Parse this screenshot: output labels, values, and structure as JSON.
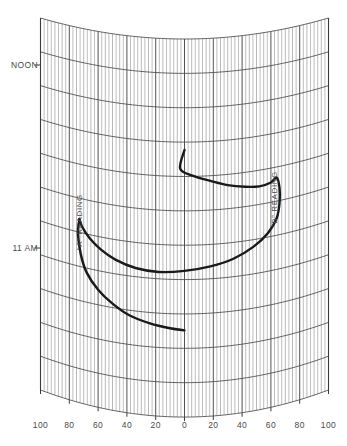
{
  "chart_data": {
    "type": "line",
    "title": "",
    "subtitle": "",
    "xlabel": "",
    "ylabel": "",
    "grid": true,
    "legend_position": "inline-annotations",
    "x_axis": {
      "tick_labels": [
        "100",
        "80",
        "60",
        "40",
        "20",
        "0",
        "20",
        "40",
        "60",
        "80",
        "100"
      ],
      "tick_values": [
        -100,
        -80,
        -60,
        -40,
        -20,
        0,
        20,
        40,
        60,
        80,
        100
      ],
      "xlim": [
        -100,
        100
      ],
      "minor_tick_step": 5
    },
    "y_axis": {
      "tick_labels": [
        "NOON",
        "11 AM"
      ],
      "tick_values": [
        12.0,
        11.0
      ],
      "ylim_top_label": "NOON",
      "ylim_bottom_label": "11 AM"
    },
    "annotations": [
      {
        "id": "a-reading",
        "text": "“A” READING",
        "orientation": "vertical",
        "x": -70,
        "y_span": [
          11.2,
          11.9
        ]
      },
      {
        "id": "b-reading",
        "text": "“B” READING",
        "orientation": "vertical",
        "x": 62,
        "y_span": [
          11.4,
          12.1
        ]
      }
    ],
    "series": [
      {
        "name": "“B” READING",
        "style": "thick-solid",
        "color": "#1a1a1a",
        "points": [
          [
            0,
            11.66
          ],
          [
            -3,
            11.56
          ],
          [
            6,
            11.52
          ],
          [
            18,
            11.49
          ],
          [
            30,
            11.46
          ],
          [
            42,
            11.44
          ],
          [
            52,
            11.43
          ],
          [
            60,
            11.44
          ],
          [
            64,
            11.46
          ],
          [
            66,
            11.4
          ],
          [
            66,
            11.32
          ],
          [
            64,
            11.24
          ],
          [
            58,
            11.17
          ],
          [
            48,
            11.11
          ],
          [
            34,
            11.06
          ],
          [
            18,
            11.03
          ],
          [
            0,
            11.01
          ],
          [
            -18,
            11.0
          ],
          [
            -34,
            11.01
          ],
          [
            -48,
            11.04
          ],
          [
            -58,
            11.08
          ],
          [
            -66,
            11.13
          ],
          [
            -71,
            11.18
          ],
          [
            -73,
            11.22
          ]
        ]
      },
      {
        "name": "“A” READING",
        "style": "thick-solid",
        "color": "#1a1a1a",
        "points": [
          [
            -73,
            11.22
          ],
          [
            -74,
            11.14
          ],
          [
            -72,
            11.03
          ],
          [
            -68,
            10.94
          ],
          [
            -60,
            10.86
          ],
          [
            -50,
            10.8
          ],
          [
            -38,
            10.75
          ],
          [
            -24,
            10.72
          ],
          [
            -10,
            10.7
          ],
          [
            0,
            10.69
          ]
        ]
      }
    ],
    "curve_note": "sun compass chart: straight azimuth lines, curved hour arcs"
  },
  "colors": {
    "background": "#ffffff",
    "grid_minor": "#8a8a8a",
    "grid_major": "#4a4a4a",
    "grid_frame": "#3a3a3a",
    "data_curve": "#1a1a1a",
    "text": "#4a4a4a"
  },
  "axis": {
    "time_labels": [
      {
        "label": "NOON"
      },
      {
        "label": "11 AM"
      }
    ],
    "bottom_labels": [
      {
        "label": "100"
      },
      {
        "label": "80"
      },
      {
        "label": "60"
      },
      {
        "label": "40"
      },
      {
        "label": "20"
      },
      {
        "label": "0"
      },
      {
        "label": "20"
      },
      {
        "label": "40"
      },
      {
        "label": "60"
      },
      {
        "label": "80"
      },
      {
        "label": "100"
      }
    ]
  },
  "annotations": {
    "a_reading": "“A” READING",
    "b_reading": "“B” READING"
  }
}
